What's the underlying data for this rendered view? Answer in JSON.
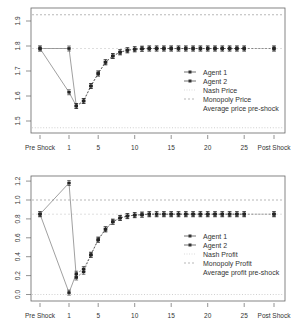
{
  "chart_data": [
    {
      "type": "line",
      "title": "",
      "xlabel": "",
      "ylabel": "",
      "ylim": [
        1.46,
        1.95
      ],
      "yticks": [
        1.5,
        1.6,
        1.7,
        1.8,
        1.9
      ],
      "ytick_labels": [
        "1.5",
        "1.6",
        "1.7",
        "1.8",
        "1.9"
      ],
      "xtick_labels": [
        "Pre Shock",
        "1",
        "5",
        "10",
        "15",
        "20",
        "25",
        "Post Shock"
      ],
      "grid": false,
      "legend_position": "right-center",
      "x": [
        "Pre Shock",
        1,
        2,
        3,
        4,
        5,
        6,
        7,
        8,
        9,
        10,
        11,
        12,
        13,
        14,
        15,
        16,
        17,
        18,
        19,
        20,
        21,
        22,
        23,
        24,
        25,
        "Post Shock"
      ],
      "series": [
        {
          "name": "Agent 1",
          "values": [
            1.79,
            1.615,
            1.56,
            1.58,
            1.64,
            1.69,
            1.735,
            1.76,
            1.775,
            1.783,
            1.787,
            1.789,
            1.79,
            1.79,
            1.79,
            1.79,
            1.79,
            1.79,
            1.79,
            1.79,
            1.79,
            1.79,
            1.79,
            1.79,
            1.79,
            1.79,
            1.79
          ]
        },
        {
          "name": "Agent 2",
          "values": [
            1.79,
            1.79,
            1.56,
            1.58,
            1.64,
            1.69,
            1.735,
            1.76,
            1.775,
            1.783,
            1.787,
            1.789,
            1.79,
            1.79,
            1.79,
            1.79,
            1.79,
            1.79,
            1.79,
            1.79,
            1.79,
            1.79,
            1.79,
            1.79,
            1.79,
            1.79,
            1.79
          ]
        }
      ],
      "reference_lines": [
        {
          "name": "Nash Price",
          "value": 1.473,
          "style": "dotted"
        },
        {
          "name": "Monopoly Price",
          "value": 1.925,
          "style": "dashed"
        },
        {
          "name": "Average price pre-shock",
          "value": 1.79,
          "style": "dashed"
        }
      ],
      "legend": [
        "Agent 1",
        "Agent 2",
        "Nash Price",
        "Monopoly Price",
        "Average price pre-shock"
      ]
    },
    {
      "type": "line",
      "title": "",
      "xlabel": "",
      "ylabel": "",
      "ylim": [
        -0.03,
        1.26
      ],
      "yticks": [
        0.0,
        0.2,
        0.4,
        0.6,
        0.8,
        1.0,
        1.2
      ],
      "ytick_labels": [
        "0.0",
        "0.2",
        "0.4",
        "0.6",
        "0.8",
        "1.0",
        "1.2"
      ],
      "xtick_labels": [
        "Pre Shock",
        "1",
        "5",
        "10",
        "15",
        "20",
        "25",
        "Post Shock"
      ],
      "grid": false,
      "legend_position": "right-center",
      "x": [
        "Pre Shock",
        1,
        2,
        3,
        4,
        5,
        6,
        7,
        8,
        9,
        10,
        11,
        12,
        13,
        14,
        15,
        16,
        17,
        18,
        19,
        20,
        21,
        22,
        23,
        24,
        25,
        "Post Shock"
      ],
      "series": [
        {
          "name": "Agent 1",
          "values": [
            0.85,
            1.18,
            0.18,
            0.24,
            0.42,
            0.58,
            0.69,
            0.77,
            0.81,
            0.83,
            0.84,
            0.845,
            0.85,
            0.85,
            0.85,
            0.85,
            0.85,
            0.85,
            0.85,
            0.85,
            0.85,
            0.85,
            0.85,
            0.85,
            0.85,
            0.85,
            0.85
          ]
        },
        {
          "name": "Agent 2",
          "values": [
            0.85,
            0.02,
            0.22,
            0.27,
            0.42,
            0.58,
            0.69,
            0.77,
            0.81,
            0.83,
            0.84,
            0.845,
            0.85,
            0.85,
            0.85,
            0.85,
            0.85,
            0.85,
            0.85,
            0.85,
            0.85,
            0.85,
            0.85,
            0.85,
            0.85,
            0.85,
            0.85
          ]
        }
      ],
      "reference_lines": [
        {
          "name": "Nash Profit",
          "value": 0.0,
          "style": "dotted"
        },
        {
          "name": "Monopoly Profit",
          "value": 1.0,
          "style": "dashed"
        },
        {
          "name": "Average profit pre-shock",
          "value": 0.85,
          "style": "dashed"
        }
      ],
      "legend": [
        "Agent 1",
        "Agent 2",
        "Nash Profit",
        "Monopoly Profit",
        "Average profit pre-shock"
      ]
    }
  ],
  "top_chart": {
    "legend": {
      "agent1": "Agent 1",
      "agent2": "Agent 2",
      "nash": "Nash Price",
      "monopoly": "Monopoly Price",
      "average": "Average price pre-shock"
    },
    "yticks": [
      "1.5",
      "1.6",
      "1.7",
      "1.8",
      "1.9"
    ],
    "xticks": [
      "Pre Shock",
      "1",
      "5",
      "10",
      "15",
      "20",
      "25",
      "Post Shock"
    ]
  },
  "bottom_chart": {
    "legend": {
      "agent1": "Agent 1",
      "agent2": "Agent 2",
      "nash": "Nash Profit",
      "monopoly": "Monopoly Profit",
      "average": "Average profit pre-shock"
    },
    "yticks": [
      "0.0",
      "0.2",
      "0.4",
      "0.6",
      "0.8",
      "1.0",
      "1.2"
    ],
    "xticks": [
      "Pre Shock",
      "1",
      "5",
      "10",
      "15",
      "20",
      "25",
      "Post Shock"
    ]
  },
  "colors": {
    "axis": "#555555",
    "series": "#333333",
    "ref_line": "#9a9a9a"
  }
}
